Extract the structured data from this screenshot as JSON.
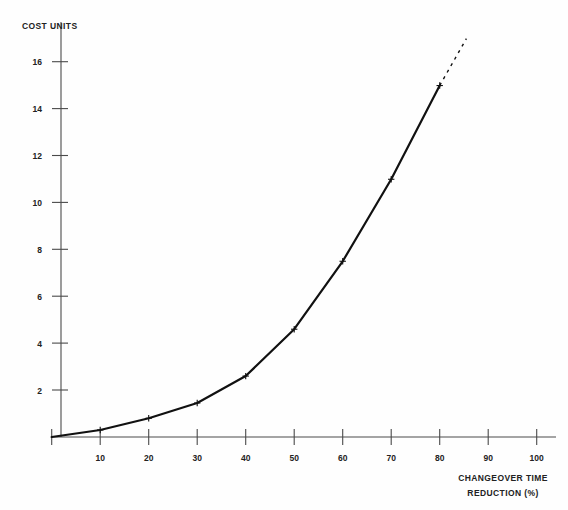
{
  "chart_data": {
    "type": "line",
    "title": "",
    "subtitle": "",
    "ylabel": "COST UNITS",
    "xlabel": "CHANGEOVER TIME",
    "xlabel_line2": "REDUCTION (%)",
    "xlim": [
      0,
      100
    ],
    "ylim": [
      0,
      17
    ],
    "grid": false,
    "legend": "none",
    "xticks": [
      10,
      20,
      30,
      40,
      50,
      60,
      70,
      80,
      90,
      100
    ],
    "xtick_labels": [
      "10",
      "20",
      "30",
      "40",
      "50",
      "60",
      "70",
      "80",
      "90",
      "100"
    ],
    "yticks": [
      2,
      4,
      6,
      8,
      10,
      12,
      14,
      16
    ],
    "ytick_labels": [
      "2",
      "4",
      "6",
      "8",
      "10",
      "12",
      "14",
      "16"
    ],
    "series": [
      {
        "name": "cost-curve-measured",
        "style": "solid",
        "marker": "plus",
        "color": "#111111",
        "x": [
          0,
          10,
          20,
          30,
          40,
          50,
          60,
          70,
          80
        ],
        "values": [
          0,
          0.3,
          0.8,
          1.45,
          2.6,
          4.6,
          7.5,
          11.0,
          15.0
        ]
      },
      {
        "name": "cost-curve-extrapolated",
        "style": "dashed",
        "marker": "none",
        "color": "#111111",
        "x": [
          80,
          85.5
        ],
        "values": [
          15.0,
          17.0
        ]
      }
    ],
    "annotations": []
  },
  "axes": {
    "y_axis_caption": "COST UNITS",
    "x_axis_caption_line1": "CHANGEOVER TIME",
    "x_axis_caption_line2": "REDUCTION (%)"
  }
}
